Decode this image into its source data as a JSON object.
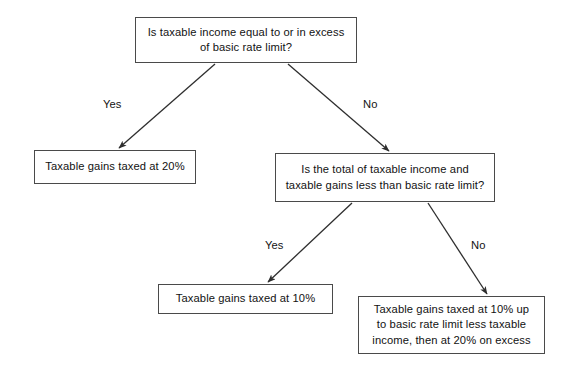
{
  "diagram": {
    "background_color": "#ffffff",
    "line_color": "#4a4a4a",
    "text_color": "#121212",
    "nodes": {
      "q1": {
        "id": "q1",
        "type": "decision",
        "text": "Is taxable income equal to or in excess\nof basic rate limit?"
      },
      "gains20": {
        "id": "gains20",
        "type": "outcome",
        "text": "Taxable gains taxed at 20%"
      },
      "q2": {
        "id": "q2",
        "type": "decision",
        "text": "Is the total of taxable income and\ntaxable gains less than basic rate limit?"
      },
      "gains10": {
        "id": "gains10",
        "type": "outcome",
        "text": "Taxable gains taxed at 10%"
      },
      "mixed": {
        "id": "mixed",
        "type": "outcome",
        "text": "Taxable gains taxed at 10% up\nto basic rate limit less taxable\nincome, then at 20% on excess"
      }
    },
    "edges": [
      {
        "id": "q1-yes",
        "from": "q1",
        "to": "gains20",
        "label": "Yes"
      },
      {
        "id": "q1-no",
        "from": "q1",
        "to": "q2",
        "label": "No"
      },
      {
        "id": "q2-yes",
        "from": "q2",
        "to": "gains10",
        "label": "Yes"
      },
      {
        "id": "q2-no",
        "from": "q2",
        "to": "mixed",
        "label": "No"
      }
    ]
  }
}
